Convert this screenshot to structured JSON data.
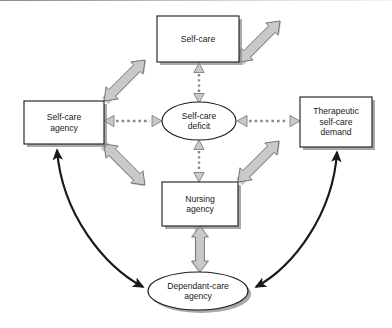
{
  "figure": {
    "kind": "conceptual-framework-diagram",
    "background_color": "#ffffff",
    "width": 392,
    "height": 328
  },
  "palette": {
    "box_fill": "#ffffff",
    "box_stroke": "#1a1a1a",
    "shadow": "#8c8c8c",
    "block_arrow_fill": "#c9c9c9",
    "block_arrow_stroke": "#6e6e6e",
    "dashed_arrow_fill": "#c9c9c9",
    "dashed_arrow_stroke": "#7a7a7a",
    "curve_arrow": "#1a1a1a",
    "text": "#1a1a1a"
  },
  "nodes": [
    {
      "id": "self-care",
      "shape": "rectangle",
      "label": "Self-care",
      "lines": [
        "Self-care"
      ],
      "x": 157,
      "y": 16,
      "w": 82,
      "h": 46
    },
    {
      "id": "self-care-agency",
      "shape": "rectangle",
      "label": "Self-care agency",
      "lines": [
        "Self-care",
        "agency"
      ],
      "x": 24,
      "y": 101,
      "w": 80,
      "h": 43
    },
    {
      "id": "therapeutic-self-care-demand",
      "shape": "rectangle",
      "label": "Therapeutic self-care demand",
      "lines": [
        "Therapeutic",
        "self-care",
        "demand"
      ],
      "x": 300,
      "y": 97,
      "w": 72,
      "h": 50
    },
    {
      "id": "self-care-deficit",
      "shape": "ellipse",
      "label": "Self-care deficit",
      "lines": [
        "Self-care",
        "deficit"
      ],
      "cx": 199,
      "cy": 121,
      "rx": 37,
      "ry": 19
    },
    {
      "id": "nursing-agency",
      "shape": "rectangle",
      "label": "Nursing agency",
      "lines": [
        "Nursing",
        "agency"
      ],
      "x": 162,
      "y": 182,
      "w": 76,
      "h": 44
    },
    {
      "id": "dependant-care-agency",
      "shape": "ellipse",
      "label": "Dependant-care agency",
      "lines": [
        "Dependant-care",
        "agency"
      ],
      "cx": 198,
      "cy": 291,
      "rx": 50,
      "ry": 19
    }
  ],
  "connectors": [
    {
      "id": "sca-to-selfcare",
      "style": "gray-block-arrow",
      "heads": "double",
      "from": "self-care-agency",
      "to": "self-care"
    },
    {
      "id": "tscd-to-selfcare",
      "style": "gray-block-arrow",
      "heads": "double",
      "from": "therapeutic-self-care-demand",
      "to": "self-care"
    },
    {
      "id": "sca-to-nursing",
      "style": "gray-block-arrow",
      "heads": "double",
      "from": "self-care-agency",
      "to": "nursing-agency"
    },
    {
      "id": "tscd-to-nursing",
      "style": "gray-block-arrow",
      "heads": "double",
      "from": "therapeutic-self-care-demand",
      "to": "nursing-agency"
    },
    {
      "id": "nursing-to-dca",
      "style": "gray-block-arrow",
      "heads": "double",
      "from": "nursing-agency",
      "to": "dependant-care-agency"
    },
    {
      "id": "selfcare-to-deficit",
      "style": "dashed-arrow",
      "heads": "double",
      "from": "self-care",
      "to": "self-care-deficit"
    },
    {
      "id": "deficit-to-nursing",
      "style": "dashed-arrow",
      "heads": "double",
      "from": "self-care-deficit",
      "to": "nursing-agency"
    },
    {
      "id": "sca-to-deficit",
      "style": "dashed-arrow",
      "heads": "double",
      "from": "self-care-agency",
      "to": "self-care-deficit"
    },
    {
      "id": "deficit-to-tscd",
      "style": "dashed-arrow",
      "heads": "double",
      "from": "self-care-deficit",
      "to": "therapeutic-self-care-demand"
    },
    {
      "id": "sca-to-dca-curve",
      "style": "black-curved-arrow",
      "heads": "double",
      "from": "self-care-agency",
      "to": "dependant-care-agency"
    },
    {
      "id": "tscd-to-dca-curve",
      "style": "black-curved-arrow",
      "heads": "double",
      "from": "therapeutic-self-care-demand",
      "to": "dependant-care-agency"
    }
  ]
}
